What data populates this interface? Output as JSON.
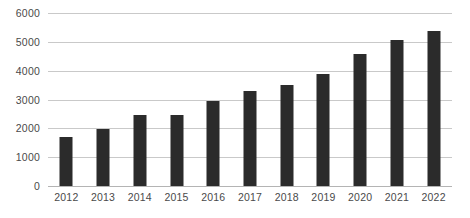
{
  "chart_data": {
    "type": "bar",
    "title": "",
    "subtitle": "",
    "xlabel": "年份",
    "ylabel": "",
    "categories": [
      "2012",
      "2013",
      "2014",
      "2015",
      "2016",
      "2017",
      "2018",
      "2019",
      "2020",
      "2021",
      "2022"
    ],
    "values": [
      1700,
      1980,
      2450,
      2470,
      2950,
      3280,
      3500,
      3880,
      4580,
      5080,
      5380
    ],
    "series": [
      {
        "name": "",
        "values": [
          1700,
          1980,
          2450,
          2470,
          2950,
          3280,
          3500,
          3880,
          4580,
          5080,
          5380
        ]
      }
    ],
    "ylim": [
      0,
      6000
    ],
    "yticks": [
      0,
      1000,
      2000,
      3000,
      4000,
      5000,
      6000
    ],
    "ytick_labels": [
      "0",
      "1000",
      "2000",
      "3000",
      "4000",
      "5000",
      "6000"
    ],
    "grid": true,
    "grid_axis": "y",
    "legend": false,
    "legend_position": "none",
    "annotations": [],
    "colors": {
      "bar": "#2b2b2b",
      "grid": "#c9c9c9",
      "axis": "#b4b4b4",
      "tick_text": "#4a4a4a",
      "background": "#ffffff"
    }
  }
}
